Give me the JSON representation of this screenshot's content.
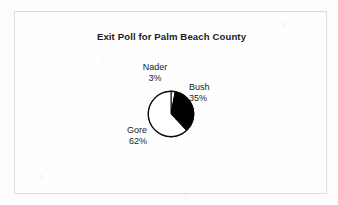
{
  "figure": {
    "title": "Exit Poll for Palm Beach County",
    "frame_color": "#dcdcdc",
    "background_color": "#fdfdfd"
  },
  "chart_data": {
    "type": "pie",
    "title": "Exit Poll for Palm Beach County",
    "xlabel": "",
    "ylabel": "",
    "legend": "none",
    "grid": false,
    "start_angle_deg": 0,
    "direction": "clockwise",
    "categories": [
      "Nader",
      "Bush",
      "Gore"
    ],
    "values": [
      3,
      35,
      62
    ],
    "unit": "%",
    "slices": [
      {
        "label": "Nader",
        "value": 3,
        "value_label": "3%",
        "color": "#ffffff",
        "edge_color": "#000000",
        "label_position": "top"
      },
      {
        "label": "Bush",
        "value": 35,
        "value_label": "35%",
        "color": "#000000",
        "edge_color": "#000000",
        "label_position": "right"
      },
      {
        "label": "Gore",
        "value": 62,
        "value_label": "62%",
        "color": "#ffffff",
        "edge_color": "#000000",
        "label_position": "lower-left"
      }
    ]
  }
}
